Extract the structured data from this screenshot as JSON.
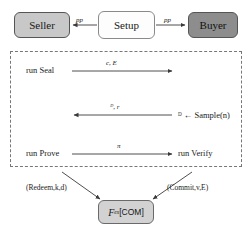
{
  "diagram": {
    "colors": {
      "seller_fill": "#c8c8c8",
      "buyer_fill": "#8d8d8d",
      "setup_fill": "#fdfdfd",
      "functionality_fill": "#d2d2d2",
      "line": "#3a3a3a",
      "dashed_border": "#777777",
      "text": "#1a1a1a"
    },
    "parties": {
      "seller": "Seller",
      "setup": "Setup",
      "buyer": "Buyer"
    },
    "setup_arrows": {
      "to_seller_label": "pp",
      "to_buyer_label": "pp"
    },
    "protocol": {
      "rows": [
        {
          "left_label": "run Seal",
          "message": "c, E",
          "direction": "right",
          "right_label": ""
        },
        {
          "left_label": "",
          "message": "ᴰ, r",
          "direction": "left",
          "right_label": "ᴰ ← Sample(n)"
        },
        {
          "left_label": "run Prove",
          "message": "π",
          "direction": "right",
          "right_label": "run Verify"
        }
      ]
    },
    "functionality": {
      "script_symbol": "F",
      "subscript": "ex",
      "bracket_label": "[COM]",
      "full_label": "ℱex[COM]",
      "left_call": "(Redeem,k,d)",
      "right_call": "(Commit,v,E)"
    }
  }
}
